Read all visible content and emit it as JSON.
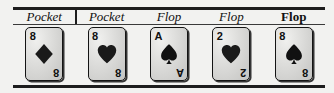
{
  "frame": {
    "background_color": "#f2f2f0",
    "rule_color": "#1d1d1d",
    "divider_after_column": 1
  },
  "columns": [
    {
      "label": "Pocket",
      "label_style": "italic",
      "card": {
        "rank": "8",
        "suit": "diamonds",
        "suit_symbol": "♦",
        "suit_color": "#1a1a1a",
        "name": "8 of Diamonds"
      }
    },
    {
      "label": "Pocket",
      "label_style": "italic",
      "card": {
        "rank": "8",
        "suit": "hearts",
        "suit_symbol": "♥",
        "suit_color": "#1a1a1a",
        "name": "8 of Hearts"
      }
    },
    {
      "label": "Flop",
      "label_style": "italic",
      "card": {
        "rank": "A",
        "suit": "spades",
        "suit_symbol": "♠",
        "suit_color": "#111111",
        "name": "Ace of Spades"
      }
    },
    {
      "label": "Flop",
      "label_style": "italic",
      "card": {
        "rank": "2",
        "suit": "hearts",
        "suit_symbol": "♥",
        "suit_color": "#1a1a1a",
        "name": "2 of Hearts"
      }
    },
    {
      "label": "Flop",
      "label_style": "bold",
      "card": {
        "rank": "8",
        "suit": "spades",
        "suit_symbol": "♠",
        "suit_color": "#111111",
        "name": "8 of Spades"
      }
    }
  ]
}
